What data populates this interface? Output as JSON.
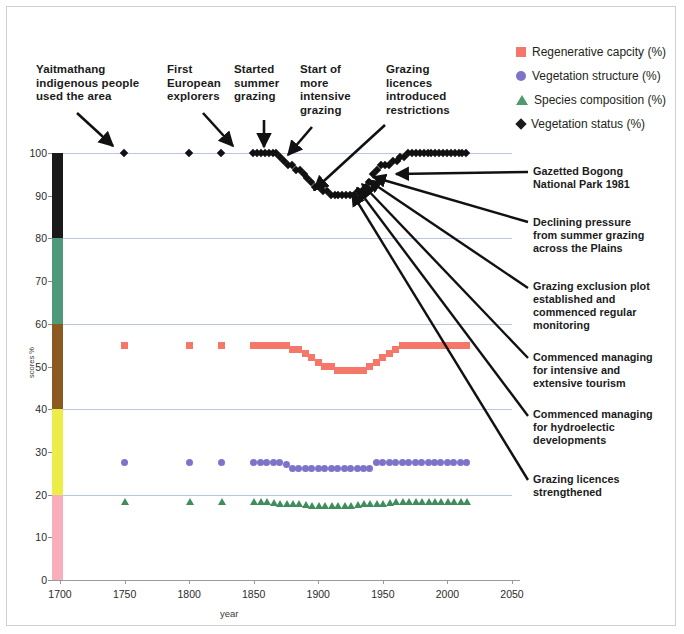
{
  "chart_data": {
    "type": "scatter",
    "title": "",
    "xlabel": "year",
    "ylabel": "scores %",
    "xlim": [
      1700,
      2050
    ],
    "ylim": [
      0,
      100
    ],
    "xticks": [
      1700,
      1750,
      1800,
      1850,
      1900,
      1950,
      2000,
      2050
    ],
    "yticks": [
      0,
      10,
      20,
      30,
      40,
      50,
      60,
      70,
      80,
      90,
      100
    ],
    "grid": "horizontal gridlines every 20 units",
    "legend_position": "top-right outside",
    "colors": {
      "regenerative_capacity": "#f4776a",
      "vegetation_structure": "#7d74c9",
      "species_composition": "#3f8c5c",
      "vegetation_status": "#111111",
      "gridline": "#b9c6dd",
      "axis": "#9a9a9a"
    },
    "yaxis_color_bands": [
      {
        "from": 80,
        "to": 100,
        "color": "#1a1a1a",
        "name": "band-80-100"
      },
      {
        "from": 60,
        "to": 80,
        "color": "#4f9a7a",
        "name": "band-60-80"
      },
      {
        "from": 40,
        "to": 60,
        "color": "#8a5a20",
        "name": "band-40-60"
      },
      {
        "from": 20,
        "to": 40,
        "color": "#eded4a",
        "name": "band-20-40"
      },
      {
        "from": 0,
        "to": 20,
        "color": "#f8aebb",
        "name": "band-0-20"
      }
    ],
    "series": [
      {
        "name": "Regenerative capcity (%)",
        "marker": "square",
        "color": "#f4776a",
        "points": [
          [
            1750,
            55
          ],
          [
            1800,
            55
          ],
          [
            1825,
            55
          ],
          [
            1850,
            55
          ],
          [
            1855,
            55
          ],
          [
            1860,
            55
          ],
          [
            1865,
            55
          ],
          [
            1870,
            55
          ],
          [
            1875,
            55
          ],
          [
            1880,
            54
          ],
          [
            1885,
            54
          ],
          [
            1890,
            53
          ],
          [
            1895,
            52
          ],
          [
            1900,
            51
          ],
          [
            1905,
            50
          ],
          [
            1910,
            50
          ],
          [
            1915,
            49
          ],
          [
            1920,
            49
          ],
          [
            1925,
            49
          ],
          [
            1930,
            49
          ],
          [
            1935,
            49
          ],
          [
            1940,
            50
          ],
          [
            1945,
            51
          ],
          [
            1950,
            52
          ],
          [
            1955,
            53
          ],
          [
            1960,
            54
          ],
          [
            1965,
            55
          ],
          [
            1970,
            55
          ],
          [
            1975,
            55
          ],
          [
            1980,
            55
          ],
          [
            1985,
            55
          ],
          [
            1990,
            55
          ],
          [
            1995,
            55
          ],
          [
            2000,
            55
          ],
          [
            2005,
            55
          ],
          [
            2010,
            55
          ],
          [
            2015,
            55
          ]
        ]
      },
      {
        "name": "Vegetation structure (%)",
        "marker": "circle",
        "color": "#7d74c9",
        "points": [
          [
            1750,
            27.5
          ],
          [
            1800,
            27.5
          ],
          [
            1825,
            27.5
          ],
          [
            1850,
            27.5
          ],
          [
            1855,
            27.5
          ],
          [
            1860,
            27.5
          ],
          [
            1865,
            27.5
          ],
          [
            1870,
            27.5
          ],
          [
            1875,
            27
          ],
          [
            1880,
            26
          ],
          [
            1885,
            26
          ],
          [
            1890,
            26
          ],
          [
            1895,
            26
          ],
          [
            1900,
            26
          ],
          [
            1905,
            26
          ],
          [
            1910,
            26
          ],
          [
            1915,
            26
          ],
          [
            1920,
            26
          ],
          [
            1925,
            26
          ],
          [
            1930,
            26
          ],
          [
            1935,
            26
          ],
          [
            1940,
            26
          ],
          [
            1945,
            27.5
          ],
          [
            1950,
            27.5
          ],
          [
            1955,
            27.5
          ],
          [
            1960,
            27.5
          ],
          [
            1965,
            27.5
          ],
          [
            1970,
            27.5
          ],
          [
            1975,
            27.5
          ],
          [
            1980,
            27.5
          ],
          [
            1985,
            27.5
          ],
          [
            1990,
            27.5
          ],
          [
            1995,
            27.5
          ],
          [
            2000,
            27.5
          ],
          [
            2005,
            27.5
          ],
          [
            2010,
            27.5
          ],
          [
            2015,
            27.5
          ]
        ]
      },
      {
        "name": "Species composition (%)",
        "marker": "triangle",
        "color": "#3f8c5c",
        "points": [
          [
            1750,
            18.5
          ],
          [
            1800,
            18.5
          ],
          [
            1825,
            18.5
          ],
          [
            1850,
            18.5
          ],
          [
            1855,
            18.5
          ],
          [
            1860,
            18.3
          ],
          [
            1865,
            18.2
          ],
          [
            1870,
            18
          ],
          [
            1875,
            18
          ],
          [
            1880,
            17.8
          ],
          [
            1885,
            17.8
          ],
          [
            1890,
            17.6
          ],
          [
            1895,
            17.5
          ],
          [
            1900,
            17.5
          ],
          [
            1905,
            17.5
          ],
          [
            1910,
            17.5
          ],
          [
            1915,
            17.5
          ],
          [
            1920,
            17.5
          ],
          [
            1925,
            17.5
          ],
          [
            1930,
            17.6
          ],
          [
            1935,
            17.8
          ],
          [
            1940,
            17.8
          ],
          [
            1945,
            18
          ],
          [
            1950,
            18
          ],
          [
            1955,
            18.2
          ],
          [
            1960,
            18.3
          ],
          [
            1965,
            18.5
          ],
          [
            1970,
            18.5
          ],
          [
            1975,
            18.5
          ],
          [
            1980,
            18.5
          ],
          [
            1985,
            18.5
          ],
          [
            1990,
            18.5
          ],
          [
            1995,
            18.5
          ],
          [
            2000,
            18.5
          ],
          [
            2005,
            18.5
          ],
          [
            2010,
            18.5
          ],
          [
            2015,
            18.5
          ]
        ]
      },
      {
        "name": "Vegetation status (%)",
        "marker": "diamond",
        "color": "#111111",
        "points": [
          [
            1750,
            100
          ],
          [
            1800,
            100
          ],
          [
            1825,
            100
          ],
          [
            1850,
            100
          ],
          [
            1853,
            100
          ],
          [
            1856,
            100
          ],
          [
            1859,
            100
          ],
          [
            1862,
            100
          ],
          [
            1865,
            100
          ],
          [
            1868,
            100
          ],
          [
            1871,
            99
          ],
          [
            1874,
            98
          ],
          [
            1877,
            97
          ],
          [
            1880,
            97
          ],
          [
            1883,
            96
          ],
          [
            1886,
            96
          ],
          [
            1889,
            95
          ],
          [
            1892,
            94
          ],
          [
            1895,
            93
          ],
          [
            1898,
            92
          ],
          [
            1901,
            92
          ],
          [
            1904,
            91
          ],
          [
            1907,
            91
          ],
          [
            1910,
            90
          ],
          [
            1913,
            90
          ],
          [
            1916,
            90
          ],
          [
            1919,
            90
          ],
          [
            1922,
            90
          ],
          [
            1925,
            90
          ],
          [
            1928,
            90
          ],
          [
            1931,
            91
          ],
          [
            1934,
            91
          ],
          [
            1937,
            92
          ],
          [
            1940,
            93
          ],
          [
            1943,
            95
          ],
          [
            1946,
            96
          ],
          [
            1949,
            97
          ],
          [
            1952,
            97
          ],
          [
            1955,
            97
          ],
          [
            1958,
            98
          ],
          [
            1961,
            98
          ],
          [
            1964,
            99
          ],
          [
            1967,
            99
          ],
          [
            1970,
            100
          ],
          [
            1973,
            100
          ],
          [
            1976,
            100
          ],
          [
            1979,
            100
          ],
          [
            1982,
            100
          ],
          [
            1985,
            100
          ],
          [
            1988,
            100
          ],
          [
            1991,
            100
          ],
          [
            1994,
            100
          ],
          [
            1997,
            100
          ],
          [
            2000,
            100
          ],
          [
            2003,
            100
          ],
          [
            2006,
            100
          ],
          [
            2009,
            100
          ],
          [
            2012,
            100
          ],
          [
            2015,
            100
          ]
        ]
      }
    ]
  },
  "legend": {
    "items": [
      {
        "label": "Regenerative capcity (%)",
        "marker": "square",
        "color": "#f4776a"
      },
      {
        "label": "Vegetation structure (%)",
        "marker": "circle",
        "color": "#7d74c9"
      },
      {
        "label": "Species composition (%)",
        "marker": "triangle",
        "color": "#4f9a6e"
      },
      {
        "label": "Vegetation status (%)",
        "marker": "diamond",
        "color": "#1a1a1a"
      }
    ]
  },
  "annotations_top": [
    {
      "id": "a1",
      "text": "Yaitmathang\nindigenous people\nused the area"
    },
    {
      "id": "a2",
      "text": "First\nEuropean\nexplorers"
    },
    {
      "id": "a3",
      "text": "Started\nsummer\ngrazing"
    },
    {
      "id": "a4",
      "text": "Start of\nmore\nintensive\ngrazing"
    },
    {
      "id": "a5",
      "text": "Grazing\nlicences\nintroduced\nrestrictions"
    }
  ],
  "annotations_right": [
    {
      "id": "r1",
      "text": "Gazetted Bogong\nNational Park 1981"
    },
    {
      "id": "r2",
      "text": "Declining pressure\nfrom summer grazing\nacross the Plains"
    },
    {
      "id": "r3",
      "text": "Grazing exclusion plot\nestablished and\ncommenced  regular\nmonitoring"
    },
    {
      "id": "r4",
      "text": "Commenced managing\nfor intensive and\nextensive tourism"
    },
    {
      "id": "r5",
      "text": "Commenced managing\nfor  hydroelectic\ndevelopments"
    },
    {
      "id": "r6",
      "text": "Grazing licences\nstrengthened"
    }
  ],
  "axes": {
    "x_title": "year",
    "y_title": "scores %",
    "x_labels": [
      "1700",
      "1750",
      "1800",
      "1850",
      "1900",
      "1950",
      "2000",
      "2050"
    ],
    "y_labels": [
      "0",
      "10",
      "20",
      "30",
      "40",
      "50",
      "60",
      "70",
      "80",
      "90",
      "100"
    ]
  }
}
